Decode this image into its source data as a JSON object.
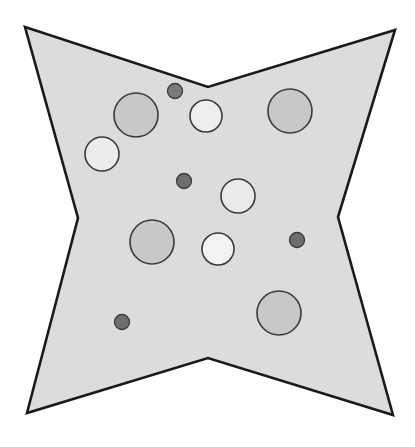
{
  "figure": {
    "title": "",
    "canvas": {
      "width": 415,
      "height": 447,
      "background": "#ffffff"
    },
    "shape": {
      "name": "four-pointed-star",
      "fill": "#dcdcdc",
      "stroke": "#1a1a1a",
      "stroke_width": 2.6,
      "points": "25,27 208,87 395,30 338,217 393,415 208,358 27,413 78,218"
    },
    "circles": [
      {
        "id": "circle-1",
        "cx": 136,
        "cy": 115,
        "r": 22,
        "fill": "#c8c8c8",
        "stroke": "#3a3a3a",
        "size": "large",
        "shade": "medium-gray"
      },
      {
        "id": "circle-2",
        "cx": 175,
        "cy": 91,
        "r": 7.5,
        "fill": "#7a7a7a",
        "stroke": "#3a3a3a",
        "size": "small",
        "shade": "dark-gray"
      },
      {
        "id": "circle-3",
        "cx": 206,
        "cy": 116,
        "r": 16,
        "fill": "#eeeeee",
        "stroke": "#3a3a3a",
        "size": "medium",
        "shade": "near-white"
      },
      {
        "id": "circle-4",
        "cx": 290,
        "cy": 111,
        "r": 22,
        "fill": "#c8c8c8",
        "stroke": "#3a3a3a",
        "size": "large",
        "shade": "medium-gray"
      },
      {
        "id": "circle-5",
        "cx": 102,
        "cy": 154,
        "r": 17,
        "fill": "#ececec",
        "stroke": "#3a3a3a",
        "size": "medium",
        "shade": "near-white"
      },
      {
        "id": "circle-6",
        "cx": 184,
        "cy": 181,
        "r": 7.5,
        "fill": "#6e6e6e",
        "stroke": "#3a3a3a",
        "size": "small",
        "shade": "dark-gray"
      },
      {
        "id": "circle-7",
        "cx": 238,
        "cy": 196,
        "r": 17,
        "fill": "#eaeaea",
        "stroke": "#3a3a3a",
        "size": "medium",
        "shade": "near-white"
      },
      {
        "id": "circle-8",
        "cx": 152,
        "cy": 242,
        "r": 22,
        "fill": "#c8c8c8",
        "stroke": "#3a3a3a",
        "size": "large",
        "shade": "medium-gray"
      },
      {
        "id": "circle-9",
        "cx": 218,
        "cy": 249,
        "r": 16,
        "fill": "#f2f2f2",
        "stroke": "#3a3a3a",
        "size": "medium",
        "shade": "near-white"
      },
      {
        "id": "circle-10",
        "cx": 297,
        "cy": 240,
        "r": 7.5,
        "fill": "#6e6e6e",
        "stroke": "#3a3a3a",
        "size": "small",
        "shade": "dark-gray"
      },
      {
        "id": "circle-11",
        "cx": 122,
        "cy": 322,
        "r": 7.5,
        "fill": "#6e6e6e",
        "stroke": "#3a3a3a",
        "size": "small",
        "shade": "dark-gray"
      },
      {
        "id": "circle-12",
        "cx": 279,
        "cy": 313,
        "r": 22,
        "fill": "#c8c8c8",
        "stroke": "#3a3a3a",
        "size": "large",
        "shade": "medium-gray"
      }
    ],
    "counts": {
      "total_circles": 12,
      "large": 4,
      "medium": 4,
      "small": 4
    }
  }
}
